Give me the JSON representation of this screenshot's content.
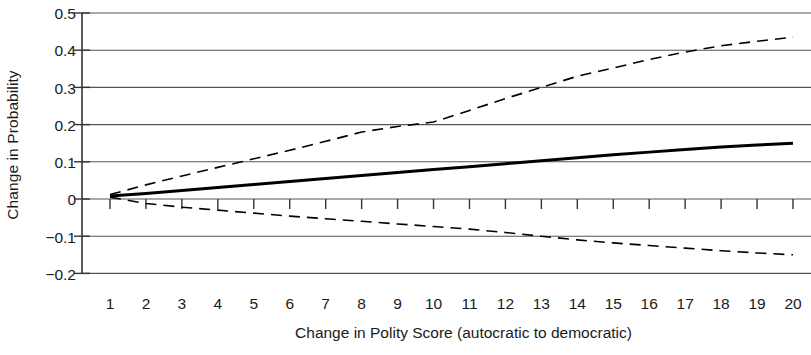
{
  "chart_data": {
    "type": "line",
    "title": "",
    "xlabel": "Change in Polity Score (autocratic to democratic)",
    "ylabel": "Change in Probability",
    "xlim": [
      1,
      20
    ],
    "ylim": [
      -0.2,
      0.5
    ],
    "grid": true,
    "legend": "none",
    "x": [
      1,
      2,
      3,
      4,
      5,
      6,
      7,
      8,
      9,
      10,
      11,
      12,
      13,
      14,
      15,
      16,
      17,
      18,
      19,
      20
    ],
    "xticklabels": [
      "1",
      "2",
      "3",
      "4",
      "5",
      "6",
      "7",
      "8",
      "9",
      "10",
      "11",
      "12",
      "13",
      "14",
      "15",
      "16",
      "17",
      "18",
      "19",
      "20"
    ],
    "yticklabels": [
      "0.5",
      "0.4",
      "0.3",
      "0.2",
      "0.1",
      "0",
      "−0.1",
      "−0.2"
    ],
    "ytickvalues": [
      0.5,
      0.4,
      0.3,
      0.2,
      0.1,
      0,
      -0.1,
      -0.2
    ],
    "series": [
      {
        "name": "Point estimate",
        "style": "solid",
        "color": "#000000",
        "width": 3,
        "values": [
          0.008,
          0.015,
          0.023,
          0.031,
          0.039,
          0.047,
          0.055,
          0.063,
          0.071,
          0.079,
          0.087,
          0.095,
          0.103,
          0.111,
          0.119,
          0.126,
          0.133,
          0.14,
          0.145,
          0.15
        ]
      },
      {
        "name": "Upper confidence bound",
        "style": "dashed",
        "color": "#000000",
        "width": 1.6,
        "values": [
          0.012,
          0.038,
          0.062,
          0.085,
          0.108,
          0.131,
          0.155,
          0.18,
          0.195,
          0.207,
          0.238,
          0.27,
          0.3,
          0.33,
          0.352,
          0.375,
          0.395,
          0.412,
          0.424,
          0.435
        ]
      },
      {
        "name": "Lower confidence bound",
        "style": "dashed",
        "color": "#000000",
        "width": 1.6,
        "values": [
          0.005,
          -0.012,
          -0.022,
          -0.03,
          -0.038,
          -0.046,
          -0.053,
          -0.06,
          -0.067,
          -0.074,
          -0.081,
          -0.09,
          -0.1,
          -0.11,
          -0.118,
          -0.125,
          -0.132,
          -0.139,
          -0.145,
          -0.15
        ]
      }
    ],
    "axis": {
      "y_axis_line": true,
      "x_tick_marks_on_zero_line": true
    }
  }
}
